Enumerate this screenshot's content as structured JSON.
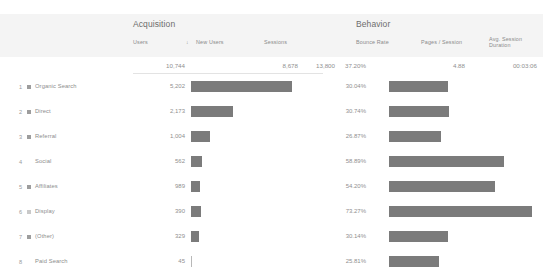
{
  "groups": {
    "acquisition": "Acquisition",
    "behavior": "Behavior"
  },
  "columns": {
    "users": "Users",
    "new_users": "New Users",
    "sessions": "Sessions",
    "bounce_rate": "Bounce Rate",
    "pages_session": "Pages / Session",
    "avg_duration_line1": "Avg. Session",
    "avg_duration_line2": "Duration",
    "sort_indicator": "↓"
  },
  "totals": {
    "users": "10,744",
    "new_users": "8,678",
    "sessions": "13,800",
    "bounce_rate": "37.20%",
    "pages_session": "4.88",
    "avg_duration": "00:03:06"
  },
  "colors": {
    "bar": "#7b7b7b",
    "header_band": "#f4f4f4",
    "text": "#8d8d8d"
  },
  "chart_data": {
    "type": "bar",
    "xlabel": "",
    "ylabel": "Default Channel Grouping",
    "categories": [
      "Organic Search",
      "Direct",
      "Referral",
      "Social",
      "Affiliates",
      "Display",
      "(Other)",
      "Paid Search"
    ],
    "series": [
      {
        "name": "Users",
        "values": [
          5202,
          2173,
          1004,
          562,
          989,
          390,
          329,
          45
        ],
        "max": 5202,
        "total": 10744
      },
      {
        "name": "Bounce Rate",
        "values": [
          30.04,
          30.74,
          26.87,
          58.89,
          54.2,
          73.27,
          30.14,
          25.81
        ],
        "max": 73.27,
        "total": 37.2,
        "unit": "%"
      }
    ],
    "grid": false,
    "legend": false
  },
  "rows": [
    {
      "rank": "1",
      "label": "Organic Search",
      "users": "5,202",
      "users_pct": 100.0,
      "bounce": "30.04%",
      "bounce_pct": 41.0,
      "swatch": "solid"
    },
    {
      "rank": "2",
      "label": "Direct",
      "users": "2,173",
      "users_pct": 41.8,
      "bounce": "30.74%",
      "bounce_pct": 42.0,
      "swatch": "solid"
    },
    {
      "rank": "3",
      "label": "Referral",
      "users": "1,004",
      "users_pct": 19.3,
      "bounce": "26.87%",
      "bounce_pct": 36.7,
      "swatch": "solid"
    },
    {
      "rank": "4",
      "label": "Social",
      "users": "562",
      "users_pct": 10.8,
      "bounce": "58.89%",
      "bounce_pct": 80.4,
      "swatch": "none"
    },
    {
      "rank": "5",
      "label": "Affiliates",
      "users": "989",
      "users_pct": 9.2,
      "bounce": "54.20%",
      "bounce_pct": 74.0,
      "swatch": "solid"
    },
    {
      "rank": "6",
      "label": "Display",
      "users": "390",
      "users_pct": 9.6,
      "bounce": "73.27%",
      "bounce_pct": 100.0,
      "swatch": "hollow"
    },
    {
      "rank": "7",
      "label": "(Other)",
      "users": "329",
      "users_pct": 8.4,
      "bounce": "30.14%",
      "bounce_pct": 41.2,
      "swatch": "solid"
    },
    {
      "rank": "8",
      "label": "Paid Search",
      "users": "45",
      "users_pct": 0.8,
      "bounce": "25.81%",
      "bounce_pct": 35.2,
      "swatch": "none"
    }
  ]
}
